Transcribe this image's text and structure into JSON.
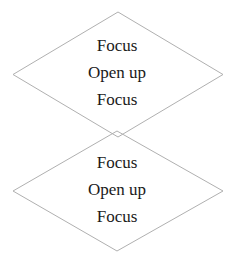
{
  "figure": {
    "background_color": "#ffffff",
    "shape_stroke_color": "#b0b0b0",
    "text_color": "#1a1a1a"
  },
  "diamonds": [
    {
      "id": "top-diamond",
      "lines": [
        "Focus",
        "Open up",
        "Focus"
      ]
    },
    {
      "id": "bottom-diamond",
      "lines": [
        "Focus",
        "Open up",
        "Focus"
      ]
    }
  ]
}
